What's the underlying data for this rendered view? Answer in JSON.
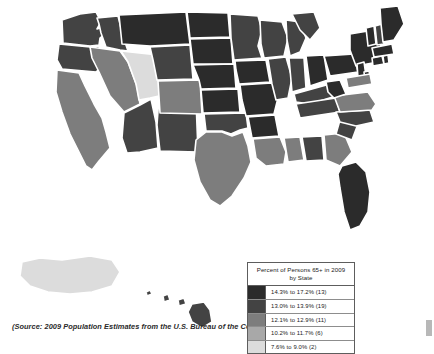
{
  "figure": {
    "caption": "(Source: 2009 Population Estimates from the U.S. Bureau of the Census)"
  },
  "legend": {
    "title": "Percent of Persons 65+ in 2009 by State",
    "title_line1": "Percent of Persons 65+ in 2009",
    "title_line2": "by State",
    "rows": [
      {
        "label": "14.3% to 17.2% (13)",
        "color": "#2b2b2b",
        "min": 14.3,
        "max": 17.2,
        "count": 13
      },
      {
        "label": "13.0% to 13.9% (19)",
        "color": "#434343",
        "min": 13.0,
        "max": 13.9,
        "count": 19
      },
      {
        "label": "12.1% to 12.9% (11)",
        "color": "#7d7d7d",
        "min": 12.1,
        "max": 12.9,
        "count": 11
      },
      {
        "label": "10.2% to 11.7% (6)",
        "color": "#a8a8a8",
        "min": 10.2,
        "max": 11.7,
        "count": 6
      },
      {
        "label": "7.6% to 9.0% (2)",
        "color": "#dcdcdc",
        "min": 7.6,
        "max": 9.0,
        "count": 2
      }
    ]
  },
  "chart_data": {
    "type": "heatmap",
    "title": "Percent of Persons 65+ in 2009 by State",
    "subtitle": "",
    "xlabel": "",
    "ylabel": "",
    "legend_position": "bottom-right",
    "grid": false,
    "value_unit": "percent",
    "bins": [
      {
        "label": "14.3% to 17.2% (13)",
        "color": "#2b2b2b",
        "count": 13
      },
      {
        "label": "13.0% to 13.9% (19)",
        "color": "#434343",
        "count": 19
      },
      {
        "label": "12.1% to 12.9% (11)",
        "color": "#7d7d7d",
        "count": 11
      },
      {
        "label": "10.2% to 11.7% (6)",
        "color": "#a8a8a8",
        "count": 6
      },
      {
        "label": "7.6% to 9.0% (2)",
        "color": "#dcdcdc",
        "count": 2
      }
    ],
    "regions": [
      {
        "name": "Washington",
        "abbr": "WA",
        "bin": 1
      },
      {
        "name": "Oregon",
        "abbr": "OR",
        "bin": 1
      },
      {
        "name": "Idaho",
        "abbr": "ID",
        "bin": 1
      },
      {
        "name": "Montana",
        "abbr": "MT",
        "bin": 0
      },
      {
        "name": "Wyoming",
        "abbr": "WY",
        "bin": 1
      },
      {
        "name": "North Dakota",
        "abbr": "ND",
        "bin": 0
      },
      {
        "name": "South Dakota",
        "abbr": "SD",
        "bin": 0
      },
      {
        "name": "Nebraska",
        "abbr": "NE",
        "bin": 0
      },
      {
        "name": "Minnesota",
        "abbr": "MN",
        "bin": 1
      },
      {
        "name": "Iowa",
        "abbr": "IA",
        "bin": 0
      },
      {
        "name": "Wisconsin",
        "abbr": "WI",
        "bin": 1
      },
      {
        "name": "Michigan",
        "abbr": "MI",
        "bin": 1
      },
      {
        "name": "Illinois",
        "abbr": "IL",
        "bin": 1
      },
      {
        "name": "Indiana",
        "abbr": "IN",
        "bin": 1
      },
      {
        "name": "Ohio",
        "abbr": "OH",
        "bin": 0
      },
      {
        "name": "Missouri",
        "abbr": "MO",
        "bin": 0
      },
      {
        "name": "Kansas",
        "abbr": "KS",
        "bin": 0
      },
      {
        "name": "Oklahoma",
        "abbr": "OK",
        "bin": 1
      },
      {
        "name": "Arkansas",
        "abbr": "AR",
        "bin": 0
      },
      {
        "name": "Louisiana",
        "abbr": "LA",
        "bin": 2
      },
      {
        "name": "Mississippi",
        "abbr": "MS",
        "bin": 2
      },
      {
        "name": "Alabama",
        "abbr": "AL",
        "bin": 1
      },
      {
        "name": "Tennessee",
        "abbr": "TN",
        "bin": 1
      },
      {
        "name": "Kentucky",
        "abbr": "KY",
        "bin": 1
      },
      {
        "name": "West Virginia",
        "abbr": "WV",
        "bin": 0
      },
      {
        "name": "Virginia",
        "abbr": "VA",
        "bin": 2
      },
      {
        "name": "North Carolina",
        "abbr": "NC",
        "bin": 1
      },
      {
        "name": "South Carolina",
        "abbr": "SC",
        "bin": 1
      },
      {
        "name": "Georgia",
        "abbr": "GA",
        "bin": 2
      },
      {
        "name": "Florida",
        "abbr": "FL",
        "bin": 0
      },
      {
        "name": "Pennsylvania",
        "abbr": "PA",
        "bin": 0
      },
      {
        "name": "New York",
        "abbr": "NY",
        "bin": 0
      },
      {
        "name": "New Jersey",
        "abbr": "NJ",
        "bin": 0
      },
      {
        "name": "Delaware",
        "abbr": "DE",
        "bin": 0
      },
      {
        "name": "Maryland",
        "abbr": "MD",
        "bin": 2
      },
      {
        "name": "Connecticut",
        "abbr": "CT",
        "bin": 0
      },
      {
        "name": "Rhode Island",
        "abbr": "RI",
        "bin": 0
      },
      {
        "name": "Massachusetts",
        "abbr": "MA",
        "bin": 0
      },
      {
        "name": "Vermont",
        "abbr": "VT",
        "bin": 0
      },
      {
        "name": "New Hampshire",
        "abbr": "NH",
        "bin": 1
      },
      {
        "name": "Maine",
        "abbr": "ME",
        "bin": 0
      },
      {
        "name": "California",
        "abbr": "CA",
        "bin": 2
      },
      {
        "name": "Nevada",
        "abbr": "NV",
        "bin": 2
      },
      {
        "name": "Utah",
        "abbr": "UT",
        "bin": 4
      },
      {
        "name": "Arizona",
        "abbr": "AZ",
        "bin": 1
      },
      {
        "name": "New Mexico",
        "abbr": "NM",
        "bin": 1
      },
      {
        "name": "Colorado",
        "abbr": "CO",
        "bin": 2
      },
      {
        "name": "Texas",
        "abbr": "TX",
        "bin": 2
      },
      {
        "name": "Alaska",
        "abbr": "AK",
        "bin": 4
      },
      {
        "name": "Hawaii",
        "abbr": "HI",
        "bin": 1
      }
    ]
  }
}
